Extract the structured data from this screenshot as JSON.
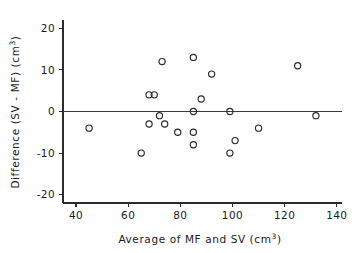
{
  "chart_data": {
    "type": "scatter",
    "title": "",
    "xlabel": "Average of MF and SV (cm3)",
    "xlabel_main": "Average of MF and SV (cm",
    "xlabel_sup": "3",
    "xlabel_tail": ")",
    "ylabel": "Difference (SV - MF) (cm3)",
    "ylabel_main": "Difference (SV - MF) (cm",
    "ylabel_sup": "3",
    "ylabel_tail": ")",
    "xlim": [
      35,
      142
    ],
    "ylim": [
      -22,
      22
    ],
    "xticks": [
      40,
      60,
      80,
      100,
      120,
      140
    ],
    "xtick_labels": [
      "40",
      "60",
      "80",
      "100",
      "120",
      "140"
    ],
    "yticks": [
      -20,
      -10,
      0,
      10,
      20
    ],
    "ytick_labels": [
      "-20",
      "-10",
      "0",
      "10",
      "20"
    ],
    "grid": false,
    "legend": "none",
    "reference_line": {
      "y": 0,
      "label": "zero-difference-line",
      "color": "#3a3a3a"
    },
    "marker": {
      "shape": "open-circle",
      "radius": 3.1,
      "color": "#2b2b2b"
    },
    "points": [
      {
        "x": 45,
        "y": -4
      },
      {
        "x": 65,
        "y": -10
      },
      {
        "x": 68,
        "y": 4
      },
      {
        "x": 70,
        "y": 4
      },
      {
        "x": 68,
        "y": -3
      },
      {
        "x": 72,
        "y": -1
      },
      {
        "x": 73,
        "y": 12
      },
      {
        "x": 74,
        "y": -3
      },
      {
        "x": 79,
        "y": -5
      },
      {
        "x": 85,
        "y": 13
      },
      {
        "x": 85,
        "y": 0
      },
      {
        "x": 85,
        "y": -5
      },
      {
        "x": 85,
        "y": -8
      },
      {
        "x": 88,
        "y": 3
      },
      {
        "x": 92,
        "y": 9
      },
      {
        "x": 99,
        "y": 0
      },
      {
        "x": 99,
        "y": -10
      },
      {
        "x": 101,
        "y": -7
      },
      {
        "x": 110,
        "y": -4
      },
      {
        "x": 125,
        "y": 11
      },
      {
        "x": 132,
        "y": -1
      }
    ]
  },
  "colors": {
    "background": "#ffffff",
    "axis": "#2b2b2b",
    "marker": "#2b2b2b",
    "reference": "#3a3a3a"
  }
}
